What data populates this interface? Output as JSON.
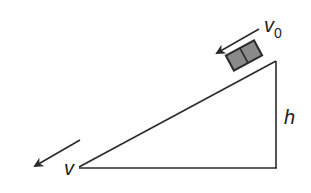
{
  "diagram": {
    "labels": {
      "initial_velocity": "v",
      "initial_velocity_sub": "0",
      "final_velocity": "v",
      "height": "h"
    },
    "colors": {
      "line": "#2a2a2a",
      "block_fill": "#8a8a8a",
      "block_stroke": "#2a2a2a"
    }
  }
}
